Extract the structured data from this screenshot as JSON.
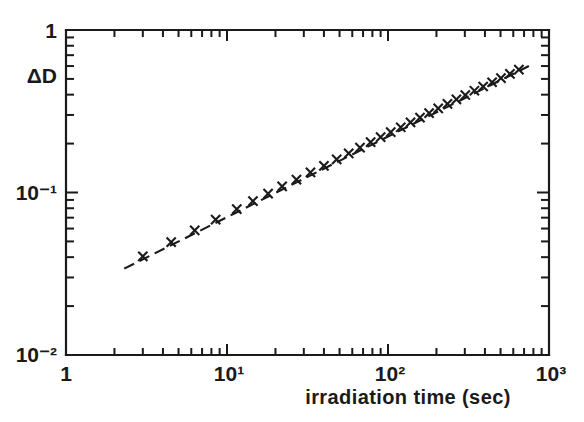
{
  "chart_data": {
    "type": "scatter",
    "title": "",
    "xlabel": "irradiation time (sec)",
    "ylabel": "ΔD",
    "xscale": "log",
    "yscale": "log",
    "xlim": [
      1,
      1000
    ],
    "ylim": [
      0.01,
      1
    ],
    "grid": false,
    "legend": null,
    "xticklabels": [
      "1",
      "10¹",
      "10²",
      "10³"
    ],
    "xtickvalues": [
      1,
      10,
      100,
      1000
    ],
    "yticklabels": [
      "1",
      "10⁻¹",
      "10⁻²"
    ],
    "ytickvalues": [
      1,
      0.1,
      0.01
    ],
    "marker": "x",
    "fit_line": {
      "style": "dashed",
      "x_start": 2.3,
      "x_end": 750,
      "y_start": 0.034,
      "y_end": 0.6,
      "slope": 0.49
    },
    "series": [
      {
        "name": "ΔD vs irradiation time",
        "x": [
          3.0,
          4.5,
          6.3,
          8.5,
          11.5,
          14.5,
          18.0,
          22.0,
          27.0,
          33.0,
          40.0,
          48.0,
          57.0,
          67.0,
          78.0,
          90.0,
          104.0,
          120.0,
          138.0,
          158.0,
          180.0,
          205.0,
          234.0,
          266.0,
          302.0,
          344.0,
          390.0,
          443.0,
          503.0,
          572.0,
          650.0
        ],
        "y": [
          0.0405,
          0.0495,
          0.0585,
          0.068,
          0.079,
          0.0885,
          0.0985,
          0.109,
          0.12,
          0.133,
          0.146,
          0.16,
          0.174,
          0.189,
          0.204,
          0.219,
          0.235,
          0.252,
          0.27,
          0.289,
          0.308,
          0.329,
          0.351,
          0.374,
          0.398,
          0.423,
          0.449,
          0.477,
          0.506,
          0.537,
          0.57
        ]
      }
    ]
  },
  "axis_labels": {
    "y_axis": "ΔD",
    "x_axis": "irradiation time (sec)",
    "y_top": "1",
    "y_mid": "10⁻¹",
    "y_bottom": "10⁻²",
    "x_left": "1",
    "x_t10": "10¹",
    "x_t100": "10²",
    "x_right": "10³"
  },
  "colors": {
    "ink": "#1a1a1a",
    "background": "#ffffff"
  }
}
